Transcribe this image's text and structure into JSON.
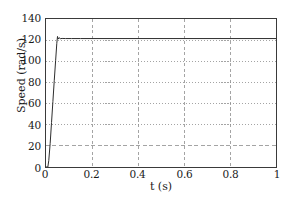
{
  "chart_data": {
    "type": "line",
    "title": "",
    "xlabel": "t (s)",
    "ylabel": "Speed (rad/s)",
    "xlim": [
      0,
      1
    ],
    "ylim": [
      0,
      140
    ],
    "xticks": [
      0,
      0.2,
      0.4,
      0.6,
      0.8,
      1
    ],
    "xticklabels": [
      "0",
      "0.2",
      "0.4",
      "0.6",
      "0.8",
      "1"
    ],
    "yticks": [
      0,
      20,
      40,
      60,
      80,
      100,
      120,
      140
    ],
    "yticklabels": [
      "0",
      "20",
      "40",
      "60",
      "80",
      "100",
      "120",
      "140"
    ],
    "grid": true,
    "grid_style": "dotted",
    "grid_color": "#8c8c8c",
    "legend": null,
    "line_color": "#2b2b2b",
    "series": [
      {
        "name": "Speed",
        "x": [
          0,
          0.008,
          0.012,
          0.018,
          0.024,
          0.03,
          0.036,
          0.042,
          0.047,
          0.05,
          0.053,
          0.057,
          0.062,
          0.07,
          0.085,
          0.11,
          0.15,
          0.2,
          0.3,
          0.4,
          0.5,
          0.6,
          0.7,
          0.8,
          0.9,
          1.0
        ],
        "y": [
          0,
          0,
          6,
          22,
          42,
          62,
          82,
          101,
          117,
          123.5,
          121.0,
          122.3,
          121.4,
          121.6,
          121.5,
          121.5,
          121.5,
          121.5,
          121.5,
          121.5,
          121.5,
          121.5,
          121.5,
          121.5,
          121.5,
          121.5
        ]
      }
    ],
    "annotations": {
      "steady_state_value": 121.5,
      "overshoot_peak": 123.5,
      "rise_time_s": 0.05
    }
  },
  "axes": {
    "y_title": "Speed (rad/s)",
    "x_title": "t (s)"
  }
}
